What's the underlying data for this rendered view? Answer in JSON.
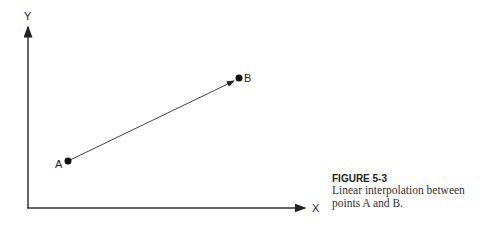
{
  "diagram": {
    "axes": {
      "x_label": "X",
      "y_label": "Y"
    },
    "points": [
      {
        "name": "A",
        "label": "A"
      },
      {
        "name": "B",
        "label": "B"
      }
    ],
    "arrow": {
      "from": "A",
      "to": "B"
    }
  },
  "caption": {
    "figure": "FIGURE 5-3",
    "text": "Linear interpolation between points A and B."
  }
}
